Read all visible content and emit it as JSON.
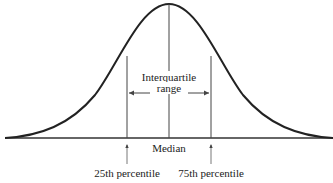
{
  "diagram": {
    "type": "normal-distribution-curve",
    "labels": {
      "iqr_line1": "Interquartile",
      "iqr_line2": "range",
      "median": "Median",
      "p25": "25th percentile",
      "p75": "75th percentile"
    },
    "colors": {
      "curve": "#222222",
      "lines": "#444444"
    }
  }
}
